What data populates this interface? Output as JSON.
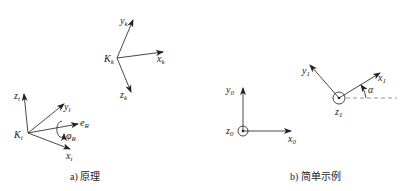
{
  "panel_a": {
    "caption": "a) 原理",
    "frame_i": {
      "origin": "K",
      "origin_sub": "i",
      "axes": [
        {
          "name": "z",
          "sub": "i"
        },
        {
          "name": "y",
          "sub": "i"
        },
        {
          "name": "e",
          "sub": "R"
        },
        {
          "name": "x",
          "sub": "i"
        }
      ],
      "rotation": {
        "name": "φ",
        "sub": "R"
      }
    },
    "frame_k": {
      "origin": "K",
      "origin_sub": "k",
      "axes": [
        {
          "name": "y",
          "sub": "k"
        },
        {
          "name": "x",
          "sub": "k"
        },
        {
          "name": "z",
          "sub": "k"
        }
      ]
    }
  },
  "panel_b": {
    "caption": "b) 简单示例",
    "frame_0": {
      "axes": [
        {
          "name": "y",
          "sub": "0"
        },
        {
          "name": "x",
          "sub": "0"
        },
        {
          "name": "z",
          "sub": "0"
        }
      ]
    },
    "frame_1": {
      "axes": [
        {
          "name": "y",
          "sub": "1"
        },
        {
          "name": "x",
          "sub": "1"
        },
        {
          "name": "z",
          "sub": "1"
        }
      ],
      "angle": "α"
    }
  }
}
